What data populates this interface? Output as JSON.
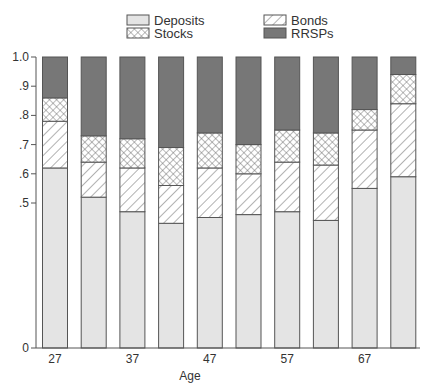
{
  "chart_data": {
    "type": "bar",
    "stacked": true,
    "title": "",
    "xlabel": "Age",
    "ylabel": "",
    "ylim": [
      0,
      1.0
    ],
    "y_axis_broken": true,
    "y_ticks": [
      {
        "value": 0,
        "label": "0"
      },
      {
        "value": 0.5,
        "label": ".5"
      },
      {
        "value": 0.6,
        "label": ".6"
      },
      {
        "value": 0.7,
        "label": ".7"
      },
      {
        "value": 0.8,
        "label": ".8"
      },
      {
        "value": 0.9,
        "label": ".9"
      },
      {
        "value": 1.0,
        "label": "1.0"
      }
    ],
    "categories": [
      27,
      32,
      37,
      42,
      47,
      52,
      57,
      62,
      67,
      72
    ],
    "x_tick_labels": [
      {
        "index": 0,
        "label": "27"
      },
      {
        "index": 2,
        "label": "37"
      },
      {
        "index": 4,
        "label": "47"
      },
      {
        "index": 6,
        "label": "57"
      },
      {
        "index": 8,
        "label": "67"
      }
    ],
    "series": [
      {
        "name": "Deposits",
        "pattern": "solid-light",
        "values": [
          0.62,
          0.52,
          0.47,
          0.43,
          0.45,
          0.46,
          0.47,
          0.44,
          0.55,
          0.59
        ]
      },
      {
        "name": "Bonds",
        "pattern": "diagonal-hatch",
        "values": [
          0.16,
          0.12,
          0.15,
          0.13,
          0.17,
          0.14,
          0.17,
          0.19,
          0.2,
          0.25
        ]
      },
      {
        "name": "Stocks",
        "pattern": "crosshatch",
        "values": [
          0.08,
          0.09,
          0.1,
          0.13,
          0.12,
          0.1,
          0.11,
          0.11,
          0.07,
          0.1
        ]
      },
      {
        "name": "RRSPs",
        "pattern": "solid-dark",
        "values": [
          0.14,
          0.27,
          0.28,
          0.31,
          0.26,
          0.3,
          0.25,
          0.26,
          0.18,
          0.06
        ]
      }
    ],
    "legend": {
      "position": "top",
      "entries": [
        "Deposits",
        "Stocks",
        "Bonds",
        "RRSPs"
      ]
    },
    "grid": false
  },
  "colors": {
    "deposits": "#e4e4e4",
    "rrsps": "#777777",
    "border": "#555555",
    "hatch": "#666666"
  }
}
